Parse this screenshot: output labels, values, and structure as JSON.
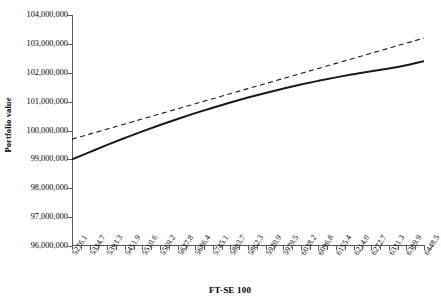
{
  "chart_data": {
    "type": "line",
    "title": "",
    "xlabel": "FT-SE 100",
    "ylabel": "Portfolio value",
    "ylim": [
      96000000,
      104000000
    ],
    "xlim": [
      5276.1,
      6448.5
    ],
    "grid": false,
    "legend": "none",
    "y_ticks": [
      "104,000,000",
      "103,000,000",
      "102,000,000",
      "101,000,000",
      "100,000,000",
      "99,000,000",
      "98,000,000",
      "97,000,000",
      "96,000,000"
    ],
    "y_tick_values": [
      104000000,
      103000000,
      102000000,
      101000000,
      100000000,
      99000000,
      98000000,
      97000000,
      96000000
    ],
    "categories": [
      "5276.1",
      "5334.7",
      "5393.3",
      "5451.9",
      "5510.6",
      "5569.2",
      "5627.8",
      "5686.4",
      "5745.1",
      "5803.7",
      "5862.3",
      "5920.9",
      "5979.5",
      "6038.2",
      "6096.8",
      "6155.4",
      "6214.0",
      "6272.7",
      "6331.3",
      "6389.9",
      "6448.5"
    ],
    "x": [
      5276.1,
      5334.7,
      5393.3,
      5451.9,
      5510.6,
      5569.2,
      5627.8,
      5686.4,
      5745.1,
      5803.7,
      5862.3,
      5920.9,
      5979.5,
      6038.2,
      6096.8,
      6155.4,
      6214.0,
      6272.7,
      6331.3,
      6389.9,
      6448.5
    ],
    "series": [
      {
        "name": "Portfolio value (solid curve)",
        "style": "solid",
        "color": "#1a1a1a",
        "values": [
          99000000,
          99250000,
          99500000,
          99740000,
          99970000,
          100190000,
          100400000,
          100600000,
          100790000,
          100970000,
          101140000,
          101300000,
          101450000,
          101590000,
          101720000,
          101840000,
          101950000,
          102050000,
          102150000,
          102260000,
          102400000
        ]
      },
      {
        "name": "Reference line (dashed)",
        "style": "dashed",
        "color": "#1a1a1a",
        "values": [
          99700000,
          99875000,
          100050000,
          100225000,
          100400000,
          100575000,
          100750000,
          100925000,
          101100000,
          101275000,
          101450000,
          101625000,
          101800000,
          101975000,
          102150000,
          102325000,
          102500000,
          102675000,
          102850000,
          103025000,
          103200000
        ]
      }
    ],
    "x_minor_tick_count": 41
  }
}
